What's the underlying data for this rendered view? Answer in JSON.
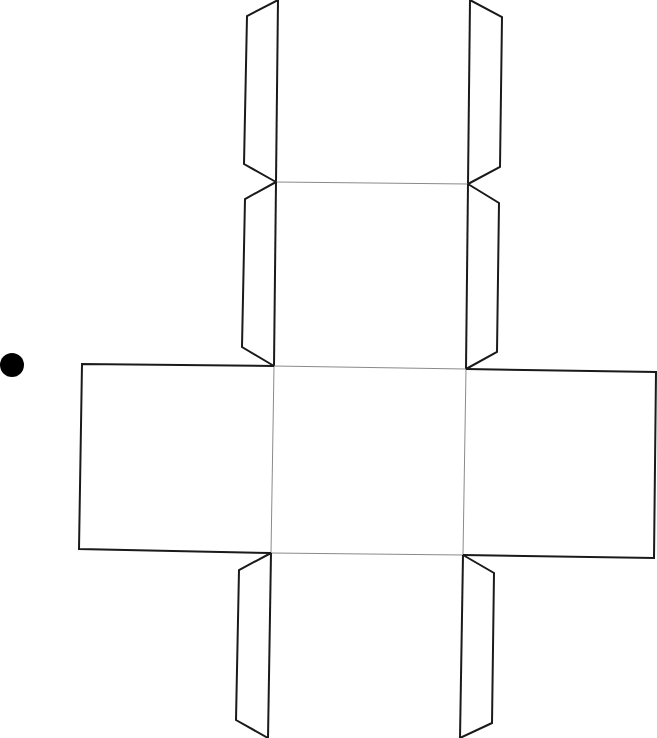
{
  "diagram": {
    "faces": 6,
    "tabs": 8,
    "line_colors": {
      "cut": "#1a1a1a",
      "fold": "#8a8a8a",
      "marker": "#000000"
    },
    "marker": {
      "shape": "dot",
      "cx": 12,
      "cy": 365,
      "r": 12
    }
  },
  "credit": {
    "text": "© ..."
  }
}
